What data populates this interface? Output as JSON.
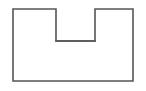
{
  "figure": {
    "shape_name": "h-shape",
    "stroke_color": "#555555",
    "fill_color": "#ffffff",
    "background_color": "#ffffff",
    "stroke_width": 1.6,
    "canvas": {
      "width": 146,
      "height": 91
    },
    "bounds": {
      "left": 13,
      "top": 9,
      "right": 133,
      "bottom": 81,
      "width": 120,
      "height": 72
    },
    "parts": [
      {
        "name": "left-rectangle",
        "left": 13,
        "top": 9,
        "right": 56,
        "bottom": 81,
        "width": 43,
        "height": 72
      },
      {
        "name": "center-rectangle",
        "left": 56,
        "top": 41,
        "right": 95,
        "bottom": 81,
        "width": 39,
        "height": 40
      },
      {
        "name": "right-rectangle",
        "left": 95,
        "top": 9,
        "right": 133,
        "bottom": 81,
        "width": 38,
        "height": 72
      }
    ],
    "crossbar": {
      "name": "horizontal-crossbar",
      "x1": 56,
      "y1": 41,
      "x2": 95,
      "y2": 41,
      "length": 39
    },
    "outline_path": "M13,9 L56,9 L56,41 L95,41 L95,9 L133,9 L133,81 L13,81 Z",
    "vertices": [
      {
        "x": 13,
        "y": 9
      },
      {
        "x": 56,
        "y": 9
      },
      {
        "x": 56,
        "y": 41
      },
      {
        "x": 95,
        "y": 41
      },
      {
        "x": 95,
        "y": 9
      },
      {
        "x": 133,
        "y": 9
      },
      {
        "x": 133,
        "y": 81
      },
      {
        "x": 13,
        "y": 81
      }
    ],
    "internal_dividers": [
      {
        "name": "left-divider",
        "x1": 56,
        "y1": 41,
        "x2": 56,
        "y2": 81
      },
      {
        "name": "right-divider",
        "x1": 95,
        "y1": 41,
        "x2": 95,
        "y2": 81
      }
    ]
  }
}
